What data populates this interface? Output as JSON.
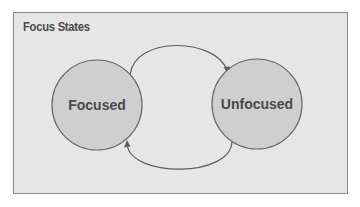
{
  "diagram": {
    "title": "Focus States",
    "states": [
      {
        "id": "focused",
        "label": "Focused"
      },
      {
        "id": "unfocused",
        "label": "Unfocused"
      }
    ],
    "transitions": [
      {
        "from": "Focused",
        "to": "Unfocused",
        "position": "top"
      },
      {
        "from": "Unfocused",
        "to": "Focused",
        "position": "bottom"
      }
    ],
    "colors": {
      "background": "#e6e6e6",
      "border": "#8a8a8a",
      "state_fill": "#cfcfcf",
      "state_stroke": "#6a6a6a",
      "text": "#4a4a4a"
    }
  }
}
